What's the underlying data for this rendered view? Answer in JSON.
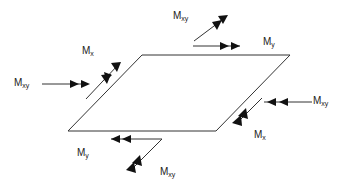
{
  "diagram": {
    "type": "plate-moments",
    "plate_shape": "parallelogram",
    "labels": {
      "mx_top_left": {
        "main": "M",
        "sub": "x"
      },
      "mxy_left": {
        "main": "M",
        "sub": "xy"
      },
      "mxy_top": {
        "main": "M",
        "sub": "xy"
      },
      "my_top_right": {
        "main": "M",
        "sub": "y"
      },
      "mxy_right": {
        "main": "M",
        "sub": "xy"
      },
      "mx_bottom_right": {
        "main": "M",
        "sub": "x"
      },
      "my_bottom_left": {
        "main": "M",
        "sub": "y"
      },
      "mxy_bottom": {
        "main": "M",
        "sub": "xy"
      }
    },
    "colors": {
      "stroke": "#222222",
      "background": "#ffffff"
    }
  }
}
